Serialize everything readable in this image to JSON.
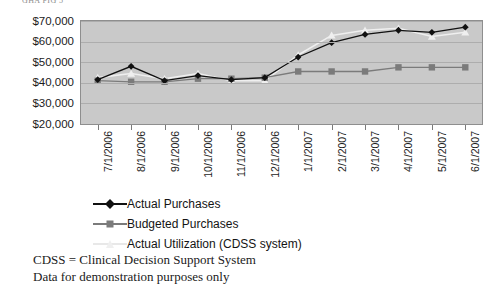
{
  "top_caption": "GHA FIG 5",
  "chart_data": {
    "type": "line",
    "title": "",
    "xlabel": "",
    "ylabel": "",
    "ylim": [
      20000,
      70000
    ],
    "ytick_step": 10000,
    "ytick_labels": [
      "$70,000",
      "$60,000",
      "$50,000",
      "$40,000",
      "$30,000",
      "$20,000"
    ],
    "ytick_values": [
      70000,
      60000,
      50000,
      40000,
      30000,
      20000
    ],
    "grid": true,
    "grid_axis": "y",
    "legend_position": "bottom",
    "categories": [
      "7/1/2006",
      "8/1/2006",
      "9/1/2006",
      "10/1/2006",
      "11/1/2006",
      "12/1/2006",
      "1/1/2007",
      "2/1/2007",
      "3/1/2007",
      "4/1/2007",
      "5/1/2007",
      "6/1/2007"
    ],
    "series": [
      {
        "name": "Actual Purchases",
        "marker": "diamond",
        "color": "#111111",
        "values": [
          41500,
          48000,
          41000,
          43500,
          41500,
          42500,
          52500,
          59500,
          63500,
          65500,
          64500,
          67000
        ]
      },
      {
        "name": "Budgeted Purchases",
        "marker": "square",
        "color": "#7b7b7b",
        "values": [
          41000,
          40500,
          40500,
          42000,
          42000,
          42500,
          45500,
          45500,
          45500,
          47500,
          47500,
          47500
        ]
      },
      {
        "name": "Actual Utilization (CDSS system)",
        "marker": "triangle",
        "color": "#efefef",
        "values": [
          42500,
          44500,
          42000,
          44500,
          41000,
          41000,
          53500,
          63000,
          65500,
          66500,
          62500,
          64500
        ]
      }
    ],
    "plot_background": "#c9c9c9",
    "gridline_color": "#adadad",
    "axis_color": "#8e8e8e"
  },
  "legend": [
    {
      "label": "Actual Purchases",
      "marker": "diamond",
      "color": "#111111",
      "line_color": "#111111"
    },
    {
      "label": "Budgeted Purchases",
      "marker": "square",
      "color": "#7b7b7b",
      "line_color": "#7b7b7b"
    },
    {
      "label": "Actual Utilization (CDSS system)",
      "marker": "triangle",
      "color": "#efefef",
      "line_color": "#e8e8e8"
    }
  ],
  "footnotes": [
    "CDSS = Clinical Decision Support System",
    "Data for demonstration purposes only"
  ]
}
